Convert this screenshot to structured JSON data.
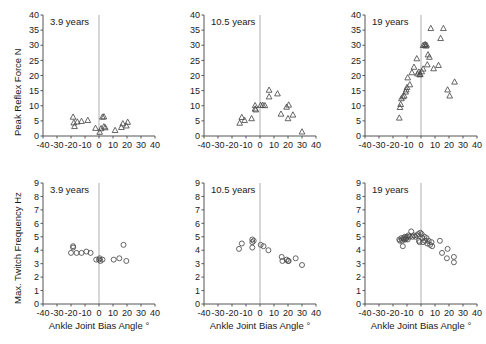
{
  "figure": {
    "background": "#ffffff",
    "axis_color": "#555555",
    "marker_color": "#4a4a4a",
    "zero_line_color": "#9a9a9a",
    "panel_count": 6
  },
  "chart_data": [
    {
      "id": "peak-reflex-force-3-9-years",
      "type": "scatter",
      "title": "3.9 years",
      "xlabel": "",
      "ylabel": "Peak Reflex Force N",
      "xlim": [
        -40,
        40
      ],
      "ylim": [
        0,
        40
      ],
      "xticks": [
        -40,
        -30,
        -20,
        -10,
        0,
        10,
        20,
        30,
        40
      ],
      "yticks": [
        0,
        5,
        10,
        15,
        20,
        25,
        30,
        35,
        40
      ],
      "xtick_labels": [
        "-40",
        "-30",
        "-20",
        "-10",
        "0",
        "10",
        "20",
        "30",
        "40"
      ],
      "ytick_labels": [
        "0",
        "5",
        "10",
        "15",
        "20",
        "25",
        "30",
        "35",
        "40"
      ],
      "marker": "triangle",
      "grid": false,
      "zero_line": true,
      "legend": "none",
      "points": [
        {
          "x": -18.5,
          "y": 6.3
        },
        {
          "x": -18.0,
          "y": 4.4
        },
        {
          "x": -17.5,
          "y": 3.2
        },
        {
          "x": -15.5,
          "y": 4.7
        },
        {
          "x": -12.5,
          "y": 4.9
        },
        {
          "x": -8.0,
          "y": 5.2
        },
        {
          "x": -2.5,
          "y": 2.6
        },
        {
          "x": 0.5,
          "y": 1.3
        },
        {
          "x": 1.5,
          "y": 2.5
        },
        {
          "x": 2.5,
          "y": 6.3
        },
        {
          "x": 3.5,
          "y": 6.4
        },
        {
          "x": 3.5,
          "y": 3.1
        },
        {
          "x": 4.5,
          "y": 2.8
        },
        {
          "x": 11.5,
          "y": 1.9
        },
        {
          "x": 16.0,
          "y": 2.9
        },
        {
          "x": 17.0,
          "y": 4.1
        },
        {
          "x": 19.5,
          "y": 3.4
        },
        {
          "x": 20.5,
          "y": 4.6
        }
      ]
    },
    {
      "id": "peak-reflex-force-10-5-years",
      "type": "scatter",
      "title": "10.5 years",
      "xlabel": "",
      "ylabel": "",
      "xlim": [
        -40,
        40
      ],
      "ylim": [
        0,
        40
      ],
      "xticks": [
        -40,
        -30,
        -20,
        -10,
        0,
        10,
        20,
        30,
        40
      ],
      "yticks": [
        0,
        5,
        10,
        15,
        20,
        25,
        30,
        35,
        40
      ],
      "xtick_labels": [
        "-40",
        "-30",
        "-20",
        "-10",
        "0",
        "10",
        "20",
        "30",
        "40"
      ],
      "ytick_labels": [
        "0",
        "5",
        "10",
        "15",
        "20",
        "25",
        "30",
        "35",
        "40"
      ],
      "marker": "triangle",
      "grid": false,
      "zero_line": true,
      "legend": "none",
      "points": [
        {
          "x": -14.5,
          "y": 4.3
        },
        {
          "x": -13.0,
          "y": 6.2
        },
        {
          "x": -11.0,
          "y": 5.2
        },
        {
          "x": -6.0,
          "y": 5.8
        },
        {
          "x": -3.5,
          "y": 10.1
        },
        {
          "x": -3.5,
          "y": 9.0
        },
        {
          "x": -3.0,
          "y": 8.7
        },
        {
          "x": 0.5,
          "y": 10.2
        },
        {
          "x": 2.0,
          "y": 10.2
        },
        {
          "x": 3.5,
          "y": 10.1
        },
        {
          "x": 6.5,
          "y": 15.2
        },
        {
          "x": 6.5,
          "y": 13.0
        },
        {
          "x": 12.5,
          "y": 14.0
        },
        {
          "x": 15.0,
          "y": 7.3
        },
        {
          "x": 19.0,
          "y": 9.6
        },
        {
          "x": 20.5,
          "y": 10.3
        },
        {
          "x": 20.0,
          "y": 5.8
        },
        {
          "x": 23.5,
          "y": 7.0
        },
        {
          "x": 30.0,
          "y": 1.4
        }
      ]
    },
    {
      "id": "peak-reflex-force-19-years",
      "type": "scatter",
      "title": "19 years",
      "xlabel": "",
      "ylabel": "",
      "xlim": [
        -40,
        40
      ],
      "ylim": [
        0,
        40
      ],
      "xticks": [
        -40,
        -30,
        -20,
        -10,
        0,
        10,
        20,
        30,
        40
      ],
      "yticks": [
        0,
        5,
        10,
        15,
        20,
        25,
        30,
        35,
        40
      ],
      "xtick_labels": [
        "-40",
        "-30",
        "-20",
        "-10",
        "0",
        "10",
        "20",
        "30",
        "40"
      ],
      "ytick_labels": [
        "0",
        "5",
        "10",
        "15",
        "20",
        "25",
        "30",
        "35",
        "40"
      ],
      "marker": "triangle",
      "grid": false,
      "zero_line": true,
      "legend": "none",
      "points": [
        {
          "x": -15.5,
          "y": 6.0
        },
        {
          "x": -15.0,
          "y": 9.5
        },
        {
          "x": -14.5,
          "y": 10.5
        },
        {
          "x": -14.0,
          "y": 12.4
        },
        {
          "x": -13.0,
          "y": 13.0
        },
        {
          "x": -12.0,
          "y": 13.3
        },
        {
          "x": -11.0,
          "y": 14.6
        },
        {
          "x": -10.5,
          "y": 15.3
        },
        {
          "x": -10.0,
          "y": 16.1
        },
        {
          "x": -9.5,
          "y": 19.3
        },
        {
          "x": -8.0,
          "y": 17.0
        },
        {
          "x": -6.5,
          "y": 21.0
        },
        {
          "x": -5.0,
          "y": 22.8
        },
        {
          "x": -3.0,
          "y": 25.6
        },
        {
          "x": -2.5,
          "y": 20.6
        },
        {
          "x": -1.5,
          "y": 21.2
        },
        {
          "x": -1.0,
          "y": 20.3
        },
        {
          "x": -0.5,
          "y": 20.4
        },
        {
          "x": 0.5,
          "y": 21.3
        },
        {
          "x": 1.5,
          "y": 22.2
        },
        {
          "x": 1.5,
          "y": 30.0
        },
        {
          "x": 2.5,
          "y": 30.1
        },
        {
          "x": 3.0,
          "y": 30.3
        },
        {
          "x": 3.5,
          "y": 29.8
        },
        {
          "x": 4.0,
          "y": 30.1
        },
        {
          "x": 4.5,
          "y": 23.6
        },
        {
          "x": 5.0,
          "y": 26.9
        },
        {
          "x": 6.0,
          "y": 26.1
        },
        {
          "x": 7.0,
          "y": 35.6
        },
        {
          "x": 9.0,
          "y": 22.3
        },
        {
          "x": 12.5,
          "y": 23.4
        },
        {
          "x": 14.0,
          "y": 32.3
        },
        {
          "x": 16.0,
          "y": 35.6
        },
        {
          "x": 19.0,
          "y": 15.3
        },
        {
          "x": 20.5,
          "y": 13.3
        },
        {
          "x": 24.0,
          "y": 17.9
        }
      ]
    },
    {
      "id": "max-twitch-frequency-3-9-years",
      "type": "scatter",
      "title": "3.9 years",
      "xlabel": "Ankle Joint Bias Angle °",
      "ylabel": "Max. Twitch Frequency Hz",
      "xlim": [
        -40,
        40
      ],
      "ylim": [
        0,
        9
      ],
      "xticks": [
        -40,
        -30,
        -20,
        -10,
        0,
        10,
        20,
        30,
        40
      ],
      "yticks": [
        0,
        1,
        2,
        3,
        4,
        5,
        6,
        7,
        8,
        9
      ],
      "xtick_labels": [
        "-40",
        "-30",
        "-20",
        "-10",
        "0",
        "10",
        "20",
        "30",
        "40"
      ],
      "ytick_labels": [
        "0",
        "1",
        "2",
        "3",
        "4",
        "5",
        "6",
        "7",
        "8",
        "9"
      ],
      "marker": "circle",
      "grid": false,
      "zero_line": true,
      "legend": "none",
      "points": [
        {
          "x": -18.5,
          "y": 4.3
        },
        {
          "x": -18.5,
          "y": 4.2
        },
        {
          "x": -20.0,
          "y": 3.8
        },
        {
          "x": -16.0,
          "y": 3.8
        },
        {
          "x": -12.5,
          "y": 3.8
        },
        {
          "x": -9.0,
          "y": 3.9
        },
        {
          "x": -6.0,
          "y": 3.8
        },
        {
          "x": -2.0,
          "y": 3.3
        },
        {
          "x": 0.0,
          "y": 3.3
        },
        {
          "x": 0.5,
          "y": 3.4
        },
        {
          "x": 1.0,
          "y": 3.2
        },
        {
          "x": 2.5,
          "y": 3.3
        },
        {
          "x": 10.5,
          "y": 3.3
        },
        {
          "x": 14.5,
          "y": 3.4
        },
        {
          "x": 17.5,
          "y": 4.4
        },
        {
          "x": 19.5,
          "y": 3.2
        }
      ]
    },
    {
      "id": "max-twitch-frequency-10-5-years",
      "type": "scatter",
      "title": "10.5 years",
      "xlabel": "Ankle Joint Bias Angle °",
      "ylabel": "",
      "xlim": [
        -40,
        40
      ],
      "ylim": [
        0,
        9
      ],
      "xticks": [
        -40,
        -30,
        -20,
        -10,
        0,
        10,
        20,
        30,
        40
      ],
      "yticks": [
        0,
        1,
        2,
        3,
        4,
        5,
        6,
        7,
        8,
        9
      ],
      "xtick_labels": [
        "-40",
        "-30",
        "-20",
        "-10",
        "0",
        "10",
        "20",
        "30",
        "40"
      ],
      "ytick_labels": [
        "0",
        "1",
        "2",
        "3",
        "4",
        "5",
        "6",
        "7",
        "8",
        "9"
      ],
      "marker": "circle",
      "grid": false,
      "zero_line": true,
      "legend": "none",
      "points": [
        {
          "x": -15.0,
          "y": 4.1
        },
        {
          "x": -13.0,
          "y": 4.5
        },
        {
          "x": -5.5,
          "y": 4.8
        },
        {
          "x": -5.5,
          "y": 4.6
        },
        {
          "x": -5.5,
          "y": 4.2
        },
        {
          "x": -4.5,
          "y": 4.7
        },
        {
          "x": 0.5,
          "y": 4.4
        },
        {
          "x": 2.5,
          "y": 4.3
        },
        {
          "x": 6.0,
          "y": 4.0
        },
        {
          "x": 15.5,
          "y": 3.5
        },
        {
          "x": 16.0,
          "y": 3.2
        },
        {
          "x": 19.0,
          "y": 3.3
        },
        {
          "x": 20.0,
          "y": 3.2
        },
        {
          "x": 20.5,
          "y": 3.2
        },
        {
          "x": 25.5,
          "y": 3.4
        },
        {
          "x": 30.0,
          "y": 2.9
        }
      ]
    },
    {
      "id": "max-twitch-frequency-19-years",
      "type": "scatter",
      "title": "19 years",
      "xlabel": "Ankle Joint Bias Angle °",
      "ylabel": "",
      "xlim": [
        -40,
        40
      ],
      "ylim": [
        0,
        9
      ],
      "xticks": [
        -40,
        -30,
        -20,
        -10,
        0,
        10,
        20,
        30,
        40
      ],
      "yticks": [
        0,
        1,
        2,
        3,
        4,
        5,
        6,
        7,
        8,
        9
      ],
      "xtick_labels": [
        "-40",
        "-30",
        "-20",
        "-10",
        "0",
        "10",
        "20",
        "30",
        "40"
      ],
      "ytick_labels": [
        "0",
        "1",
        "2",
        "3",
        "4",
        "5",
        "6",
        "7",
        "8",
        "9"
      ],
      "marker": "circle",
      "grid": false,
      "zero_line": true,
      "legend": "none",
      "points": [
        {
          "x": -15.5,
          "y": 4.8
        },
        {
          "x": -15.0,
          "y": 4.7
        },
        {
          "x": -14.0,
          "y": 4.9
        },
        {
          "x": -13.5,
          "y": 4.7
        },
        {
          "x": -13.0,
          "y": 4.3
        },
        {
          "x": -12.5,
          "y": 4.9
        },
        {
          "x": -12.0,
          "y": 4.8
        },
        {
          "x": -11.5,
          "y": 5.0
        },
        {
          "x": -11.0,
          "y": 4.8
        },
        {
          "x": -10.5,
          "y": 4.9
        },
        {
          "x": -10.0,
          "y": 5.0
        },
        {
          "x": -9.5,
          "y": 4.8
        },
        {
          "x": -9.0,
          "y": 5.1
        },
        {
          "x": -8.0,
          "y": 5.0
        },
        {
          "x": -7.0,
          "y": 5.4
        },
        {
          "x": -6.0,
          "y": 5.0
        },
        {
          "x": -5.0,
          "y": 5.1
        },
        {
          "x": -4.0,
          "y": 5.0
        },
        {
          "x": -3.0,
          "y": 5.1
        },
        {
          "x": -2.0,
          "y": 5.2
        },
        {
          "x": -1.5,
          "y": 4.7
        },
        {
          "x": -1.0,
          "y": 4.6
        },
        {
          "x": -0.5,
          "y": 5.3
        },
        {
          "x": 0.5,
          "y": 5.2
        },
        {
          "x": 1.0,
          "y": 4.9
        },
        {
          "x": 1.5,
          "y": 4.6
        },
        {
          "x": 2.5,
          "y": 5.0
        },
        {
          "x": 3.0,
          "y": 4.7
        },
        {
          "x": 4.0,
          "y": 4.9
        },
        {
          "x": 4.5,
          "y": 4.5
        },
        {
          "x": 5.5,
          "y": 4.7
        },
        {
          "x": 6.5,
          "y": 4.4
        },
        {
          "x": 7.5,
          "y": 4.6
        },
        {
          "x": 8.0,
          "y": 4.3
        },
        {
          "x": 13.5,
          "y": 4.7
        },
        {
          "x": 15.0,
          "y": 3.8
        },
        {
          "x": 19.0,
          "y": 4.1
        },
        {
          "x": 18.5,
          "y": 3.4
        },
        {
          "x": 23.5,
          "y": 3.5
        },
        {
          "x": 23.5,
          "y": 3.1
        }
      ]
    }
  ]
}
